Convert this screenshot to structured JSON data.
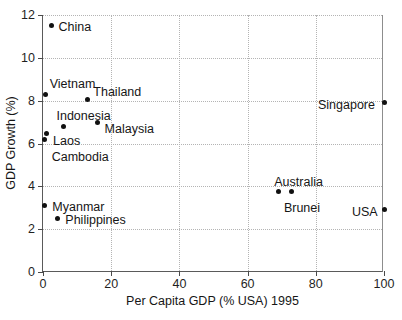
{
  "chart_data": {
    "type": "scatter",
    "title": "",
    "xlabel": "Per Capita GDP (% USA) 1995",
    "ylabel": "GDP Growth (%)",
    "xlim": [
      0,
      100
    ],
    "ylim": [
      0,
      12
    ],
    "xticks": [
      0,
      20,
      40,
      60,
      80,
      100
    ],
    "yticks": [
      0,
      2,
      4,
      6,
      8,
      10,
      12
    ],
    "xtick_labels": [
      "0",
      "20",
      "40",
      "60",
      "80",
      "100"
    ],
    "ytick_labels": [
      "0",
      "2",
      "4",
      "6",
      "8",
      "10",
      "12"
    ],
    "grid": true,
    "legend": "none",
    "marker_color": "#111111",
    "grid_color": "#b4b4b4",
    "axis_color": "#5a5a5a",
    "points": [
      {
        "label": "China",
        "x": 2.5,
        "y": 11.5,
        "label_dx": 7,
        "label_dy": -5
      },
      {
        "label": "Vietnam",
        "x": 0.8,
        "y": 8.3,
        "label_dx": 4,
        "label_dy": -16
      },
      {
        "label": "Thailand",
        "x": 13.0,
        "y": 8.05,
        "label_dx": 6,
        "label_dy": -14
      },
      {
        "label": "Indonesia",
        "x": 6.0,
        "y": 6.8,
        "label_dx": -7,
        "label_dy": -16
      },
      {
        "label": "Malaysia",
        "x": 16.0,
        "y": 7.0,
        "label_dx": 7,
        "label_dy": 1
      },
      {
        "label": "Laos",
        "x": 0.9,
        "y": 6.45,
        "label_dx": 7,
        "label_dy": 1
      },
      {
        "label": "Cambodia",
        "x": 0.5,
        "y": 6.2,
        "label_dx": 7,
        "label_dy": 12
      },
      {
        "label": "Myanmar",
        "x": 0.4,
        "y": 3.1,
        "label_dx": 8,
        "label_dy": -5
      },
      {
        "label": "Philippines",
        "x": 4.2,
        "y": 2.5,
        "label_dx": 8,
        "label_dy": -4
      },
      {
        "label": "Australia",
        "x": 69.0,
        "y": 3.75,
        "label_dx": -4,
        "label_dy": -16
      },
      {
        "label": "Brunei",
        "x": 73.0,
        "y": 3.75,
        "label_dx": -8,
        "label_dy": 10
      },
      {
        "label": "Singapore",
        "x": 100.0,
        "y": 7.9,
        "label_dx": -66,
        "label_dy": -4
      },
      {
        "label": "USA",
        "x": 100.0,
        "y": 2.9,
        "label_dx": -32,
        "label_dy": -4
      }
    ]
  },
  "caption": {
    "text": ""
  }
}
